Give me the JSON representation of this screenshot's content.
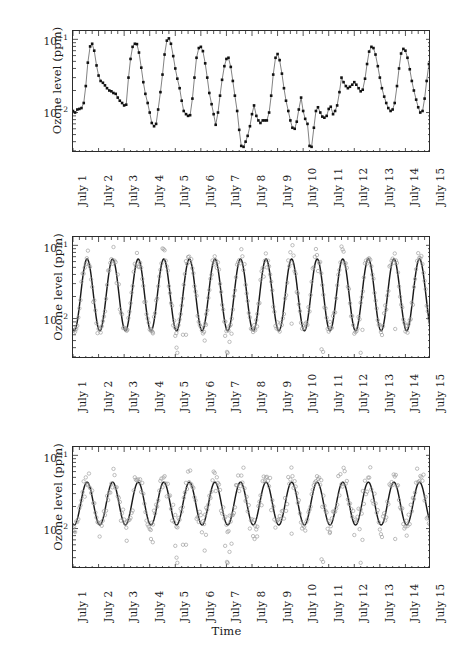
{
  "figure": {
    "axis_title_x": "Time",
    "axis_title_y": "Ozone level (ppm)",
    "caption": ""
  },
  "yticks": [
    {
      "label": "10",
      "exp": "−1",
      "value": 0.1
    },
    {
      "label": "10",
      "exp": "−2",
      "value": 0.01
    }
  ],
  "xticks": [
    "July 1",
    "July 2",
    "July 3",
    "July 4",
    "July 5",
    "July 6",
    "July 7",
    "July 8",
    "July 9",
    "July 10",
    "July 11",
    "July 12",
    "July 13",
    "July 14",
    "July 15"
  ],
  "panels": [
    {
      "name": "observed-series",
      "ylabel": "Ozone level (ppm)"
    },
    {
      "name": "fitted-large-amplitude",
      "ylabel": "Ozone level (ppm)"
    },
    {
      "name": "fitted-small-amplitude",
      "ylabel": "Ozone level (ppm)"
    }
  ],
  "colors": {
    "line": "#1a1a1a",
    "marker_filled": "#111111",
    "marker_open": "#9a9a9a",
    "fit_curve": "#1a1a1a",
    "axis": "#2b2b2b",
    "background": "#ffffff"
  },
  "chart_data": [
    {
      "type": "line",
      "title": "",
      "xlabel": "",
      "ylabel": "Ozone level (ppm)",
      "yscale": "log",
      "ylim": [
        0.0028,
        0.13
      ],
      "xlim": [
        1,
        15
      ],
      "grid": false,
      "legend": "none",
      "marker": "filled-square",
      "connected": true,
      "xtick_labels": [
        "July 1",
        "July 2",
        "July 3",
        "July 4",
        "July 5",
        "July 6",
        "July 7",
        "July 8",
        "July 9",
        "July 10",
        "July 11",
        "July 12",
        "July 13",
        "July 14",
        "July 15"
      ],
      "series": [
        {
          "name": "Observed ozone",
          "x": [
            1.0,
            1.08,
            1.17,
            1.25,
            1.33,
            1.42,
            1.5,
            1.58,
            1.67,
            1.75,
            1.83,
            1.92,
            2.0,
            2.08,
            2.17,
            2.25,
            2.33,
            2.42,
            2.5,
            2.58,
            2.67,
            2.75,
            2.83,
            2.92,
            3.0,
            3.08,
            3.17,
            3.25,
            3.33,
            3.42,
            3.5,
            3.58,
            3.67,
            3.75,
            3.83,
            3.92,
            4.0,
            4.08,
            4.17,
            4.25,
            4.33,
            4.42,
            4.5,
            4.58,
            4.67,
            4.75,
            4.83,
            4.92,
            5.0,
            5.08,
            5.17,
            5.25,
            5.33,
            5.42,
            5.5,
            5.58,
            5.67,
            5.75,
            5.83,
            5.92,
            6.0,
            6.08,
            6.17,
            6.25,
            6.33,
            6.42,
            6.5,
            6.58,
            6.67,
            6.75,
            6.83,
            6.92,
            7.0,
            7.08,
            7.17,
            7.25,
            7.33,
            7.42,
            7.5,
            7.58,
            7.67,
            7.75,
            7.83,
            7.92,
            8.0,
            8.08,
            8.17,
            8.25,
            8.33,
            8.42,
            8.5,
            8.58,
            8.67,
            8.75,
            8.83,
            8.92,
            9.0,
            9.08,
            9.17,
            9.25,
            9.33,
            9.42,
            9.5,
            9.58,
            9.67,
            9.75,
            9.83,
            9.92,
            10.0,
            10.08,
            10.17,
            10.25,
            10.33,
            10.42,
            10.5,
            10.58,
            10.67,
            10.75,
            10.83,
            10.92,
            11.0,
            11.08,
            11.17,
            11.25,
            11.33,
            11.42,
            11.5,
            11.58,
            11.67,
            11.75,
            11.83,
            11.92,
            12.0,
            12.08,
            12.17,
            12.25,
            12.33,
            12.42,
            12.5,
            12.58,
            12.67,
            12.75,
            12.83,
            12.92,
            13.0,
            13.08,
            13.17,
            13.25,
            13.33,
            13.42,
            13.5,
            13.58,
            13.67,
            13.75,
            13.83,
            13.92,
            14.0,
            14.08,
            14.17,
            14.25,
            14.33,
            14.42,
            14.5,
            14.58,
            14.67,
            14.75,
            14.83,
            14.92,
            15.0
          ],
          "y": [
            0.0105,
            0.01,
            0.011,
            0.0112,
            0.0115,
            0.0135,
            0.023,
            0.048,
            0.08,
            0.087,
            0.07,
            0.044,
            0.032,
            0.027,
            0.0255,
            0.0235,
            0.0215,
            0.02,
            0.0195,
            0.0185,
            0.018,
            0.016,
            0.0145,
            0.0135,
            0.0125,
            0.0128,
            0.03,
            0.054,
            0.079,
            0.087,
            0.086,
            0.066,
            0.041,
            0.026,
            0.018,
            0.0135,
            0.01,
            0.0072,
            0.0065,
            0.007,
            0.011,
            0.019,
            0.033,
            0.062,
            0.096,
            0.103,
            0.087,
            0.059,
            0.04,
            0.029,
            0.0215,
            0.0145,
            0.0105,
            0.0095,
            0.009,
            0.0092,
            0.0155,
            0.03,
            0.056,
            0.076,
            0.079,
            0.069,
            0.047,
            0.03,
            0.0185,
            0.013,
            0.0095,
            0.0068,
            0.01,
            0.017,
            0.028,
            0.043,
            0.054,
            0.056,
            0.042,
            0.027,
            0.017,
            0.0105,
            0.0058,
            0.0035,
            0.0034,
            0.004,
            0.0048,
            0.0065,
            0.0095,
            0.0125,
            0.009,
            0.0078,
            0.0072,
            0.0078,
            0.0078,
            0.0078,
            0.01,
            0.017,
            0.033,
            0.056,
            0.063,
            0.052,
            0.034,
            0.0215,
            0.0145,
            0.0105,
            0.0078,
            0.0062,
            0.006,
            0.0075,
            0.011,
            0.016,
            0.0105,
            0.0082,
            0.007,
            0.0035,
            0.0034,
            0.0062,
            0.0105,
            0.0118,
            0.01,
            0.0088,
            0.0085,
            0.009,
            0.0112,
            0.012,
            0.0095,
            0.0105,
            0.0125,
            0.019,
            0.03,
            0.026,
            0.023,
            0.0215,
            0.0225,
            0.024,
            0.026,
            0.024,
            0.0215,
            0.0195,
            0.0205,
            0.029,
            0.046,
            0.068,
            0.079,
            0.076,
            0.062,
            0.043,
            0.03,
            0.0215,
            0.0165,
            0.0135,
            0.0115,
            0.0105,
            0.011,
            0.0135,
            0.023,
            0.04,
            0.064,
            0.074,
            0.07,
            0.056,
            0.039,
            0.027,
            0.02,
            0.015,
            0.0118,
            0.01,
            0.0105,
            0.0155,
            0.027,
            0.046,
            0.056
          ]
        }
      ]
    },
    {
      "type": "line",
      "title": "",
      "xlabel": "",
      "ylabel": "Ozone level (ppm)",
      "yscale": "log",
      "ylim": [
        0.0028,
        0.13
      ],
      "xlim": [
        1,
        15
      ],
      "grid": false,
      "legend": "none",
      "description": "Fitted diurnal sinusoid (large amplitude) with observed data as open circles",
      "xtick_labels": [
        "July 1",
        "July 2",
        "July 3",
        "July 4",
        "July 5",
        "July 6",
        "July 7",
        "July 8",
        "July 9",
        "July 10",
        "July 11",
        "July 12",
        "July 13",
        "July 14",
        "July 15"
      ],
      "fit": {
        "name": "Fitted curve",
        "form": "log-sinusoid, period 1 day",
        "peak": 0.065,
        "trough": 0.0068,
        "peak_phase_fraction": 0.55
      },
      "scatter": {
        "name": "Observed ozone",
        "marker": "open-circle",
        "color": "#9a9a9a",
        "peak_range": [
          0.055,
          0.098
        ],
        "trough_range": [
          0.003,
          0.0095
        ]
      }
    },
    {
      "type": "line",
      "title": "",
      "xlabel": "Time",
      "ylabel": "Ozone level (ppm)",
      "yscale": "log",
      "ylim": [
        0.0028,
        0.13
      ],
      "xlim": [
        1,
        15
      ],
      "grid": false,
      "legend": "none",
      "description": "Fitted diurnal sinusoid (small amplitude) with observed data as open circles scattering beyond the fit",
      "xtick_labels": [
        "July 1",
        "July 2",
        "July 3",
        "July 4",
        "July 5",
        "July 6",
        "July 7",
        "July 8",
        "July 9",
        "July 10",
        "July 11",
        "July 12",
        "July 13",
        "July 14",
        "July 15"
      ],
      "fit": {
        "name": "Fitted curve",
        "form": "log-sinusoid, period 1 day",
        "peak": 0.043,
        "trough": 0.0112,
        "peak_phase_fraction": 0.55
      },
      "scatter": {
        "name": "Observed ozone",
        "marker": "open-circle",
        "color": "#9a9a9a",
        "peak_range": [
          0.05,
          0.1
        ],
        "trough_range": [
          0.003,
          0.0105
        ]
      }
    }
  ]
}
